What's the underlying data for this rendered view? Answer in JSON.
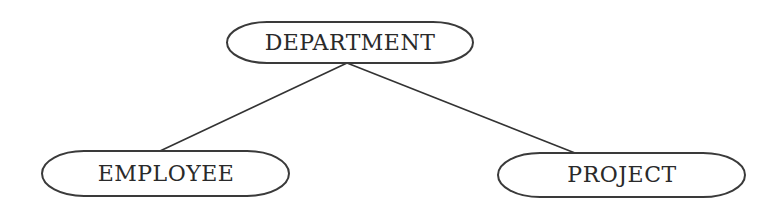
{
  "diagram": {
    "type": "hierarchy-tree",
    "colors": {
      "stroke": "#3a3a3a",
      "text": "#2a2a2a",
      "background": "#ffffff"
    },
    "nodes": [
      {
        "id": "department",
        "label": "DEPARTMENT",
        "shape": "rounded-ellipse",
        "level": 0
      },
      {
        "id": "employee",
        "label": "EMPLOYEE",
        "shape": "rounded-ellipse",
        "level": 1
      },
      {
        "id": "project",
        "label": "PROJECT",
        "shape": "rounded-ellipse",
        "level": 1
      }
    ],
    "edges": [
      {
        "from": "department",
        "to": "employee"
      },
      {
        "from": "department",
        "to": "project"
      }
    ]
  }
}
